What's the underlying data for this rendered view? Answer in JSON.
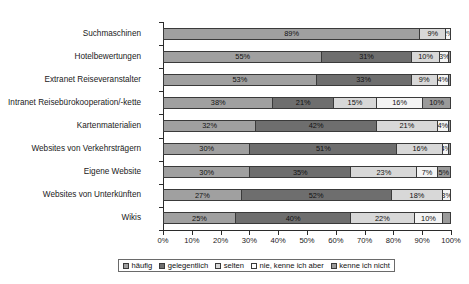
{
  "chart_data": {
    "type": "bar",
    "subtype": "stacked-horizontal-100pct",
    "title": "",
    "xlabel": "",
    "ylabel": "",
    "xlim": [
      0,
      100
    ],
    "xticks": [
      "0%",
      "10%",
      "20%",
      "30%",
      "40%",
      "50%",
      "60%",
      "70%",
      "80%",
      "90%",
      "100%"
    ],
    "grid": false,
    "legend_position": "bottom",
    "categories": [
      "Suchmaschinen",
      "Hotelbewertungen",
      "Extranet Reiseveranstalter",
      "Intranet Reisebürokooperation/-kette",
      "Kartenmaterialien",
      "Websites von Verkehrsträgern",
      "Eigene Website",
      "Websites von Unterkünften",
      "Wikis"
    ],
    "series": [
      {
        "name": "häufig",
        "color": "#a0a0a0",
        "values": [
          89,
          55,
          53,
          38,
          32,
          30,
          30,
          27,
          25
        ]
      },
      {
        "name": "gelegentlich",
        "color": "#6e6e6e",
        "values": [
          0,
          31,
          33,
          21,
          42,
          51,
          35,
          52,
          40
        ]
      },
      {
        "name": "selten",
        "color": "#d8d8d8",
        "values": [
          9,
          10,
          9,
          15,
          21,
          16,
          23,
          18,
          22
        ]
      },
      {
        "name": "nie, kenne ich aber",
        "color": "#f4f4f4",
        "values": [
          2,
          3,
          4,
          16,
          4,
          2,
          7,
          3,
          10
        ]
      },
      {
        "name": "kenne ich nicht",
        "color": "#9a9a9a",
        "values": [
          0,
          1,
          1,
          10,
          1,
          1,
          5,
          0,
          3
        ]
      }
    ],
    "bar_labels": [
      [
        "89%",
        "",
        "9%",
        "2%",
        ""
      ],
      [
        "55%",
        "31%",
        "10%",
        "3%",
        ""
      ],
      [
        "53%",
        "33%",
        "9%",
        "4%",
        ""
      ],
      [
        "38%",
        "21%",
        "15%",
        "16%",
        "10%"
      ],
      [
        "32%",
        "42%",
        "21%",
        "4%",
        ""
      ],
      [
        "30%",
        "51%",
        "16%",
        "4%",
        ""
      ],
      [
        "30%",
        "35%",
        "23%",
        "7%",
        "5%"
      ],
      [
        "27%",
        "52%",
        "18%",
        "3%",
        ""
      ],
      [
        "25%",
        "40%",
        "22%",
        "10%",
        ""
      ]
    ]
  },
  "legend": {
    "items": [
      {
        "label": "häufig"
      },
      {
        "label": "gelegentlich"
      },
      {
        "label": "selten"
      },
      {
        "label": "nie, kenne ich aber"
      },
      {
        "label": "kenne ich nicht"
      }
    ]
  }
}
